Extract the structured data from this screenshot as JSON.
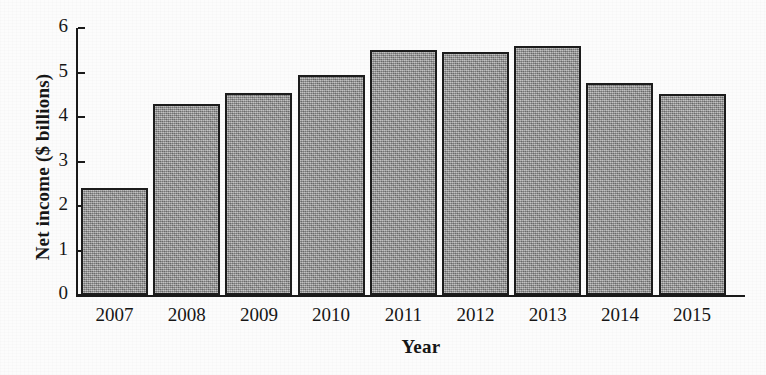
{
  "chart_data": {
    "type": "bar",
    "title": "",
    "xlabel": "Year",
    "ylabel": "Net income ($ billions)",
    "categories": [
      "2007",
      "2008",
      "2009",
      "2010",
      "2011",
      "2012",
      "2013",
      "2014",
      "2015"
    ],
    "values": [
      2.4,
      4.3,
      4.53,
      4.94,
      5.5,
      5.46,
      5.6,
      4.76,
      4.52
    ],
    "ylim": [
      0,
      6
    ],
    "yticks": [
      "0",
      "1",
      "2",
      "3",
      "4",
      "5",
      "6"
    ],
    "ytick_values": [
      0,
      1,
      2,
      3,
      4,
      5,
      6
    ],
    "grid": false,
    "legend": false,
    "legend_position": "none",
    "bar_color": "#9a9a9a",
    "bar_edge_color": "#1c1c1c",
    "axis_color": "#1a1a1a",
    "background_color": "#fcfcfc"
  }
}
